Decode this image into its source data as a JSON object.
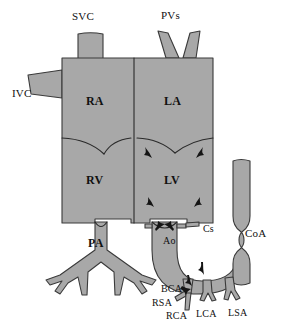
{
  "figure": {
    "type": "anatomical-schematic",
    "colors": {
      "fill": "#a8a8a8",
      "outline": "#3a3a3a",
      "label": "#111111",
      "background": "#ffffff"
    }
  },
  "labels": {
    "svc": "SVC",
    "pvs": "PVs",
    "ivc": "IVC",
    "ra": "RA",
    "la": "LA",
    "rv": "RV",
    "lv": "LV",
    "pa": "PA",
    "ao": "Ao",
    "cs": "Cs",
    "coa": "CoA",
    "bca": "BCA",
    "rsa": "RSA",
    "rca": "RCA",
    "lca": "LCA",
    "lsa": "LSA"
  },
  "label_positions": {
    "svc": {
      "x": 72,
      "y": 11,
      "cls": "lbl-vessel"
    },
    "pvs": {
      "x": 161,
      "y": 10,
      "cls": "lbl-vessel"
    },
    "ivc": {
      "x": 12,
      "y": 88,
      "cls": "lbl-vessel"
    },
    "ra": {
      "x": 86,
      "y": 95,
      "cls": "lbl-chamber"
    },
    "la": {
      "x": 164,
      "y": 95,
      "cls": "lbl-chamber"
    },
    "rv": {
      "x": 86,
      "y": 174,
      "cls": "lbl-chamber"
    },
    "lv": {
      "x": 164,
      "y": 174,
      "cls": "lbl-chamber"
    },
    "pa": {
      "x": 88,
      "y": 237,
      "cls": "lbl-chamber"
    },
    "ao": {
      "x": 163,
      "y": 236,
      "cls": "lbl-small"
    },
    "cs": {
      "x": 203,
      "y": 224,
      "cls": "lbl-small"
    },
    "coa": {
      "x": 245,
      "y": 228,
      "cls": "lbl-vessel"
    },
    "bca": {
      "x": 161,
      "y": 284,
      "cls": "lbl-small"
    },
    "rsa": {
      "x": 152,
      "y": 298,
      "cls": "lbl-small"
    },
    "rca": {
      "x": 166,
      "y": 311,
      "cls": "lbl-small"
    },
    "lca": {
      "x": 196,
      "y": 309,
      "cls": "lbl-small"
    },
    "lsa": {
      "x": 228,
      "y": 308,
      "cls": "lbl-small"
    }
  }
}
